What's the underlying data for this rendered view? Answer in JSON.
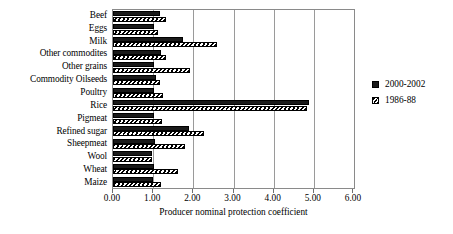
{
  "chart_data": {
    "type": "bar",
    "orientation": "horizontal",
    "title": "",
    "xlabel": "Producer nominal protection coefficient",
    "ylabel": "",
    "xlim": [
      0.0,
      6.0
    ],
    "xticks": [
      "0.00",
      "1.00",
      "2.00",
      "3.00",
      "4.00",
      "5.00",
      "6.00"
    ],
    "xtick_values": [
      0,
      1,
      2,
      3,
      4,
      5,
      6
    ],
    "grid": true,
    "legend_position": "right",
    "categories": [
      "Beef",
      "Eggs",
      "Milk",
      "Other commodites",
      "Other grains",
      "Commodity Oilseeds",
      "Poultry",
      "Rice",
      "Pigmeat",
      "Refined sugar",
      "Sheepmeat",
      "Wool",
      "Wheat",
      "Maize"
    ],
    "series": [
      {
        "name": "2000-2002",
        "style": "solid",
        "color": "#1a1a1a",
        "values": [
          1.18,
          1.02,
          1.75,
          1.2,
          1.01,
          1.08,
          1.02,
          4.88,
          1.03,
          1.88,
          1.04,
          0.96,
          1.02,
          1.0
        ]
      },
      {
        "name": "1986-88",
        "style": "hatched",
        "color": "#ffffff",
        "values": [
          1.33,
          1.12,
          2.6,
          1.33,
          1.92,
          1.18,
          1.25,
          4.82,
          1.22,
          2.27,
          1.8,
          0.97,
          1.61,
          1.2
        ]
      }
    ]
  },
  "legend": {
    "entries": [
      {
        "label": "2000-2002",
        "swatch": "solid-square-icon"
      },
      {
        "label": "1986-88",
        "swatch": "hatched-square-icon"
      }
    ]
  }
}
